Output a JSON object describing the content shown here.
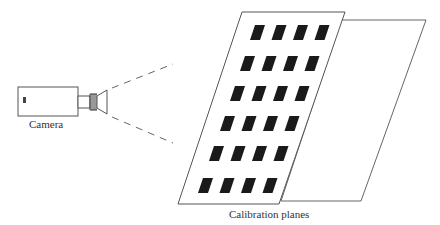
{
  "diagram": {
    "type": "camera-calibration-setup",
    "labels": {
      "camera": "Camera",
      "planes": "Calibration planes"
    },
    "camera": {
      "body": {
        "x": 18,
        "y": 87,
        "w": 60,
        "h": 29
      },
      "lens": "tube-with-rings-and-flare"
    },
    "field_of_view": {
      "style": "dashed",
      "upper": [
        [
          112,
          88
        ],
        [
          173,
          64
        ]
      ],
      "lower": [
        [
          112,
          117
        ],
        [
          173,
          143
        ]
      ]
    },
    "planes": [
      {
        "name": "front",
        "pattern": "4x6 black rectangles",
        "corners": [
          [
            242,
            12
          ],
          [
            345,
            12
          ],
          [
            279,
            204
          ],
          [
            178,
            204
          ]
        ]
      },
      {
        "name": "back",
        "pattern": "blank",
        "corners": [
          [
            341,
            20
          ],
          [
            426,
            20
          ],
          [
            361,
            201
          ],
          [
            281,
            201
          ]
        ]
      }
    ],
    "grid": {
      "rows": 6,
      "cols": 4
    },
    "colors": {
      "line": "#555555",
      "marker": "#1a1a1a",
      "background": "#ffffff"
    }
  }
}
